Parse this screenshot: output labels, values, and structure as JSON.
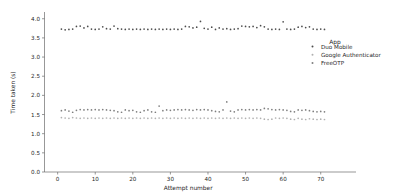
{
  "chart_data": {
    "type": "scatter",
    "title": "",
    "xlabel": "Attempt number",
    "ylabel": "Time taken (s)",
    "xlim": [
      -3.5,
      73
    ],
    "ylim": [
      0.0,
      4.15
    ],
    "xticks": [
      0,
      10,
      20,
      30,
      40,
      50,
      60,
      70
    ],
    "yticks": [
      0.0,
      0.5,
      1.0,
      1.5,
      2.0,
      2.5,
      3.0,
      3.5,
      4.0
    ],
    "xticklabels": [
      "0",
      "10",
      "20",
      "30",
      "40",
      "50",
      "60",
      "70"
    ],
    "yticklabels": [
      "0.0",
      "0.5",
      "1.0",
      "1.5",
      "2.0",
      "2.5",
      "3.0",
      "3.5",
      "4.0"
    ],
    "grid": false,
    "legend": {
      "title": "App",
      "position": "center-right",
      "entries": [
        {
          "name": "Duo Mobile",
          "color": "#4c4c4c"
        },
        {
          "name": "Google Authenticator",
          "color": "#b0b0b0"
        },
        {
          "name": "FreeOTP",
          "color": "#7f7f7f"
        }
      ]
    },
    "series": [
      {
        "name": "Duo Mobile",
        "color": "#4c4c4c",
        "marker": "circle",
        "x": [
          1,
          2,
          3,
          4,
          5,
          6,
          7,
          8,
          9,
          10,
          11,
          12,
          13,
          14,
          15,
          16,
          17,
          18,
          19,
          20,
          21,
          22,
          23,
          24,
          25,
          26,
          27,
          28,
          29,
          30,
          31,
          32,
          33,
          34,
          35,
          36,
          37,
          38,
          39,
          40,
          41,
          42,
          43,
          44,
          45,
          46,
          47,
          48,
          49,
          50,
          51,
          52,
          53,
          54,
          55,
          56,
          57,
          58,
          59,
          60,
          61,
          62,
          63,
          64,
          65,
          66,
          67,
          68,
          69,
          70,
          71
        ],
        "y": [
          3.73,
          3.71,
          3.72,
          3.73,
          3.8,
          3.81,
          3.76,
          3.8,
          3.73,
          3.72,
          3.73,
          3.79,
          3.74,
          3.73,
          3.81,
          3.74,
          3.73,
          3.72,
          3.73,
          3.72,
          3.73,
          3.72,
          3.73,
          3.72,
          3.73,
          3.72,
          3.73,
          3.72,
          3.73,
          3.72,
          3.73,
          3.72,
          3.73,
          3.8,
          3.79,
          3.76,
          3.78,
          3.93,
          3.75,
          3.73,
          3.78,
          3.72,
          3.76,
          3.73,
          3.74,
          3.72,
          3.73,
          3.74,
          3.81,
          3.8,
          3.79,
          3.8,
          3.77,
          3.82,
          3.79,
          3.73,
          3.72,
          3.73,
          3.72,
          3.92,
          3.73,
          3.72,
          3.73,
          3.78,
          3.8,
          3.77,
          3.79,
          3.73,
          3.72,
          3.73,
          3.72
        ]
      },
      {
        "name": "FreeOTP",
        "color": "#7f7f7f",
        "marker": "circle",
        "x": [
          1,
          2,
          3,
          4,
          5,
          6,
          7,
          8,
          9,
          10,
          11,
          12,
          13,
          14,
          15,
          16,
          17,
          18,
          19,
          20,
          21,
          22,
          23,
          24,
          25,
          26,
          27,
          28,
          29,
          30,
          31,
          32,
          33,
          34,
          35,
          36,
          37,
          38,
          39,
          40,
          41,
          42,
          43,
          44,
          45,
          46,
          47,
          48,
          49,
          50,
          51,
          52,
          53,
          54,
          55,
          56,
          57,
          58,
          59,
          60,
          61,
          62,
          63,
          64,
          65,
          66,
          67,
          68,
          69,
          70,
          71
        ],
        "y": [
          1.6,
          1.62,
          1.59,
          1.56,
          1.61,
          1.63,
          1.62,
          1.63,
          1.62,
          1.63,
          1.62,
          1.63,
          1.62,
          1.61,
          1.6,
          1.57,
          1.56,
          1.62,
          1.6,
          1.61,
          1.57,
          1.56,
          1.6,
          1.62,
          1.57,
          1.56,
          1.72,
          1.6,
          1.62,
          1.61,
          1.62,
          1.63,
          1.62,
          1.63,
          1.62,
          1.61,
          1.63,
          1.62,
          1.63,
          1.62,
          1.6,
          1.58,
          1.57,
          1.62,
          1.83,
          1.59,
          1.57,
          1.62,
          1.63,
          1.62,
          1.63,
          1.62,
          1.63,
          1.62,
          1.66,
          1.65,
          1.63,
          1.62,
          1.63,
          1.62,
          1.61,
          1.58,
          1.57,
          1.62,
          1.61,
          1.62,
          1.6,
          1.58,
          1.57,
          1.58,
          1.57
        ]
      },
      {
        "name": "Google Authenticator",
        "color": "#b0b0b0",
        "marker": "circle",
        "x": [
          1,
          2,
          3,
          4,
          5,
          6,
          7,
          8,
          9,
          10,
          11,
          12,
          13,
          14,
          15,
          16,
          17,
          18,
          19,
          20,
          21,
          22,
          23,
          24,
          25,
          26,
          27,
          28,
          29,
          30,
          31,
          32,
          33,
          34,
          35,
          36,
          37,
          38,
          39,
          40,
          41,
          42,
          43,
          44,
          45,
          46,
          47,
          48,
          49,
          50,
          51,
          52,
          53,
          54,
          55,
          56,
          57,
          58,
          59,
          60,
          61,
          62,
          63,
          64,
          65,
          66,
          67,
          68,
          69,
          70,
          71
        ],
        "y": [
          1.42,
          1.41,
          1.4,
          1.42,
          1.41,
          1.4,
          1.41,
          1.4,
          1.41,
          1.4,
          1.41,
          1.4,
          1.41,
          1.4,
          1.41,
          1.4,
          1.41,
          1.4,
          1.41,
          1.4,
          1.41,
          1.4,
          1.41,
          1.4,
          1.41,
          1.4,
          1.41,
          1.4,
          1.41,
          1.4,
          1.41,
          1.4,
          1.41,
          1.4,
          1.41,
          1.4,
          1.41,
          1.4,
          1.41,
          1.4,
          1.41,
          1.4,
          1.41,
          1.4,
          1.41,
          1.4,
          1.41,
          1.4,
          1.41,
          1.4,
          1.41,
          1.4,
          1.41,
          1.4,
          1.38,
          1.37,
          1.38,
          1.41,
          1.4,
          1.41,
          1.4,
          1.38,
          1.37,
          1.4,
          1.38,
          1.37,
          1.39,
          1.38,
          1.37,
          1.38,
          1.37
        ]
      }
    ]
  }
}
